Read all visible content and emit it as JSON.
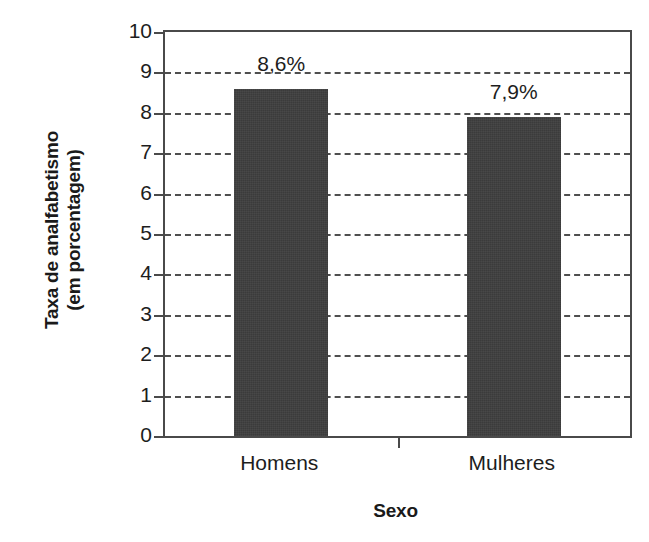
{
  "chart_data": {
    "type": "bar",
    "title": "",
    "subtitle": "",
    "categories": [
      "Homens",
      "Mulheres"
    ],
    "values": [
      8.6,
      7.9
    ],
    "data_labels": [
      "8,6%",
      "7,9%"
    ],
    "xlabel": "Sexo",
    "ylabel": "Taxa de analfabetismo (em porcentagem)",
    "ylabel_lines": [
      "Taxa de analfabetismo",
      "(em porcentagem)"
    ],
    "ylim": [
      0,
      10
    ],
    "ytick_values": [
      0,
      1,
      2,
      3,
      4,
      5,
      6,
      7,
      8,
      9,
      10
    ],
    "ytick_labels": [
      "0",
      "1",
      "2",
      "3",
      "4",
      "5",
      "6",
      "7",
      "8",
      "9",
      "10"
    ],
    "grid": true,
    "gridline_style": "dashed",
    "gridline_values": [
      1,
      2,
      3,
      4,
      5,
      6,
      7,
      8,
      9
    ],
    "legend": null,
    "legend_position": "none",
    "series": [
      {
        "name": "Taxa de analfabetismo",
        "values": [
          8.6,
          7.9
        ]
      }
    ],
    "colors": {
      "bar_fill": "#3b3b3b",
      "axis": "#4a4a4a",
      "gridline": "#4f4f4f",
      "text": "#1d1d1d",
      "background": "#ffffff"
    }
  }
}
